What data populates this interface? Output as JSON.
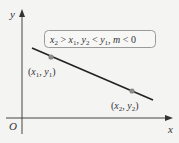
{
  "diagram": {
    "type": "line-slope-diagram",
    "axes": {
      "x_label": "x",
      "y_label": "y",
      "origin_label": "O"
    },
    "condition_box": {
      "text": "x₂ > x₁, y₂ < y₁, m < 0",
      "parts": [
        "x",
        "2",
        " > ",
        "x",
        "1",
        ", ",
        "y",
        "2",
        " < ",
        "y",
        "1",
        ", ",
        "m",
        " < 0"
      ]
    },
    "points": [
      {
        "label": "(x₁, y₁)",
        "x": "x",
        "x_sub": "1",
        "y": "y",
        "y_sub": "1"
      },
      {
        "label": "(x₂, y₂)",
        "x": "x",
        "x_sub": "2",
        "y": "y",
        "y_sub": "2"
      }
    ],
    "colors": {
      "background": "#f4f4f3",
      "axis": "#444444",
      "line": "#222222",
      "point": "#8a8a8a",
      "box_border": "#9a9a9a",
      "text": "#333333"
    }
  }
}
